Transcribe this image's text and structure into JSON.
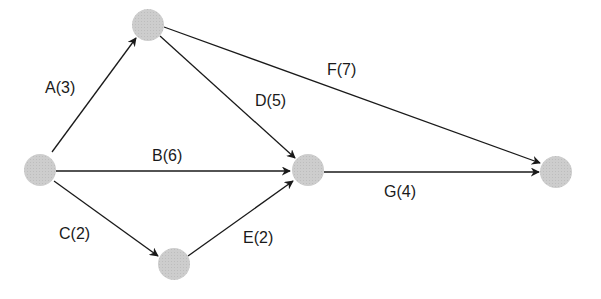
{
  "diagram": {
    "type": "activity-on-arrow network",
    "colors": {
      "node": "#c8c8c8",
      "edge": "#1a1a1a",
      "text": "#1a1a1a",
      "background": "#ffffff"
    },
    "nodes": [
      {
        "id": "start",
        "x": 40,
        "y": 170
      },
      {
        "id": "top",
        "x": 148,
        "y": 25
      },
      {
        "id": "middle",
        "x": 308,
        "y": 170
      },
      {
        "id": "bottom",
        "x": 174,
        "y": 264
      },
      {
        "id": "end",
        "x": 556,
        "y": 170
      }
    ],
    "edges": [
      {
        "from": "start",
        "to": "top",
        "label": "A(3)",
        "activity": "A",
        "duration": 3
      },
      {
        "from": "start",
        "to": "middle",
        "label": "B(6)",
        "activity": "B",
        "duration": 6
      },
      {
        "from": "start",
        "to": "bottom",
        "label": "C(2)",
        "activity": "C",
        "duration": 2
      },
      {
        "from": "top",
        "to": "middle",
        "label": "D(5)",
        "activity": "D",
        "duration": 5
      },
      {
        "from": "bottom",
        "to": "middle",
        "label": "E(2)",
        "activity": "E",
        "duration": 2
      },
      {
        "from": "top",
        "to": "end",
        "label": "F(7)",
        "activity": "F",
        "duration": 7
      },
      {
        "from": "middle",
        "to": "end",
        "label": "G(4)",
        "activity": "G",
        "duration": 4
      }
    ]
  }
}
